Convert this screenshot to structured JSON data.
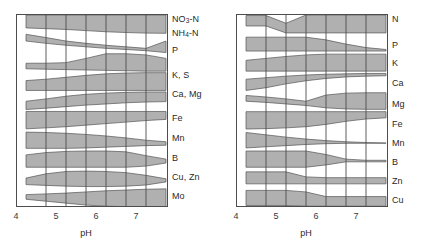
{
  "figure": {
    "band_fill": "#b0b0b0",
    "band_stroke": "#555555",
    "grid_color": "#4d4d4d",
    "frame_color": "#4d4d4d",
    "background": "#ffffff"
  },
  "panels": [
    {
      "id": "left",
      "xaxis": {
        "title": "pH",
        "min": 3.75,
        "max": 7.55,
        "tick_values": [
          4,
          5,
          6,
          7
        ],
        "tick_labels": [
          "4",
          "5",
          "6",
          "7"
        ],
        "gridline_values": [
          4.5,
          5.0,
          5.5,
          6.0,
          6.5,
          7.0
        ]
      },
      "nutrients": [
        {
          "label": "NO3-N",
          "label_html": "NO<sub>3</sub>-N"
        },
        {
          "label": "NH4-N",
          "label_html": "NH<sub>4</sub>-N"
        },
        {
          "label": "P",
          "label_html": "P"
        },
        {
          "label": "K, S",
          "label_html": "K, S"
        },
        {
          "label": "Ca, Mg",
          "label_html": "Ca, Mg"
        },
        {
          "label": "Fe",
          "label_html": "Fe"
        },
        {
          "label": "Mn",
          "label_html": "Mn"
        },
        {
          "label": "B",
          "label_html": "B"
        },
        {
          "label": "Cu, Zn",
          "label_html": "Cu, Zn"
        },
        {
          "label": "Mo",
          "label_html": "Mo"
        }
      ]
    },
    {
      "id": "right",
      "xaxis": {
        "title": "pH",
        "min": 3.75,
        "max": 7.55,
        "tick_values": [
          4,
          5,
          6,
          7
        ],
        "tick_labels": [
          "4",
          "5",
          "6",
          "7"
        ],
        "gridline_values": [
          4.5,
          5.0,
          5.5,
          6.0,
          6.5,
          7.0
        ]
      },
      "nutrients": [
        {
          "label": "N",
          "label_html": "N"
        },
        {
          "label": "P",
          "label_html": "P"
        },
        {
          "label": "K",
          "label_html": "K"
        },
        {
          "label": "Ca",
          "label_html": "Ca"
        },
        {
          "label": "Mg",
          "label_html": "Mg"
        },
        {
          "label": "Fe",
          "label_html": "Fe"
        },
        {
          "label": "Mn",
          "label_html": "Mn"
        },
        {
          "label": "B",
          "label_html": "B"
        },
        {
          "label": "Zn",
          "label_html": "Zn"
        },
        {
          "label": "Cu",
          "label_html": "Cu"
        }
      ]
    }
  ],
  "chart_data": {
    "type": "area",
    "title": "",
    "xlabel": "pH",
    "ylabel": "",
    "xlim": [
      3.75,
      7.55
    ],
    "grid": true,
    "legend": "right-side nutrient labels",
    "note": "Each horizontal band's thickness represents relative nutrient availability across pH. Band vertical extent given as top/bottom offsets (0 = top of the band's row slot, 1 = bottom) sampled at pH control points.",
    "charts": [
      {
        "panel": "left",
        "x": [
          4.0,
          4.5,
          5.0,
          5.5,
          6.0,
          6.5,
          7.0,
          7.5
        ],
        "bands": [
          {
            "name": "NO3-N",
            "top": [
              0.05,
              0.05,
              0.05,
              0.05,
              0.05,
              0.05,
              0.05,
              0.05
            ],
            "bottom": [
              0.72,
              0.76,
              0.8,
              0.86,
              0.92,
              0.96,
              0.99,
              1.0
            ]
          },
          {
            "name": "NH4-N",
            "top": [
              0.05,
              0.22,
              0.4,
              0.52,
              0.62,
              0.7,
              0.78,
              0.4
            ],
            "bottom": [
              0.4,
              0.52,
              0.62,
              0.7,
              0.78,
              0.84,
              0.9,
              1.0
            ]
          },
          {
            "name": "P",
            "top": [
              0.55,
              0.55,
              0.52,
              0.3,
              0.06,
              0.06,
              0.12,
              0.3
            ],
            "bottom": [
              0.84,
              0.86,
              0.88,
              0.9,
              0.92,
              0.94,
              0.96,
              0.96
            ]
          },
          {
            "name": "K, S",
            "top": [
              0.45,
              0.38,
              0.28,
              0.18,
              0.1,
              0.06,
              0.04,
              0.04
            ],
            "bottom": [
              0.96,
              0.96,
              0.96,
              0.96,
              0.96,
              0.96,
              0.96,
              0.96
            ]
          },
          {
            "name": "Ca, Mg",
            "top": [
              0.52,
              0.4,
              0.26,
              0.16,
              0.1,
              0.06,
              0.04,
              0.04
            ],
            "bottom": [
              0.95,
              0.88,
              0.8,
              0.72,
              0.66,
              0.6,
              0.56,
              0.54
            ]
          },
          {
            "name": "Fe",
            "top": [
              0.05,
              0.05,
              0.05,
              0.05,
              0.05,
              0.05,
              0.05,
              0.05
            ],
            "bottom": [
              0.95,
              0.9,
              0.84,
              0.76,
              0.68,
              0.6,
              0.52,
              0.46
            ]
          },
          {
            "name": "Mn",
            "top": [
              0.12,
              0.14,
              0.18,
              0.24,
              0.32,
              0.42,
              0.54,
              0.62
            ],
            "bottom": [
              0.96,
              0.96,
              0.96,
              0.94,
              0.9,
              0.86,
              0.82,
              0.8
            ]
          },
          {
            "name": "B",
            "top": [
              0.3,
              0.18,
              0.12,
              0.1,
              0.1,
              0.14,
              0.34,
              0.52
            ],
            "bottom": [
              0.94,
              0.94,
              0.94,
              0.94,
              0.94,
              0.94,
              0.88,
              0.72
            ]
          },
          {
            "name": "Cu, Zn",
            "top": [
              0.5,
              0.28,
              0.16,
              0.14,
              0.16,
              0.22,
              0.36,
              0.54
            ],
            "bottom": [
              0.84,
              0.88,
              0.92,
              0.94,
              0.94,
              0.92,
              0.86,
              0.7
            ]
          },
          {
            "name": "Mo",
            "top": [
              0.36,
              0.32,
              0.28,
              0.22,
              0.16,
              0.12,
              0.08,
              0.06
            ],
            "bottom": [
              0.6,
              0.7,
              0.8,
              0.9,
              0.96,
              0.98,
              0.99,
              1.0
            ]
          }
        ]
      },
      {
        "panel": "right",
        "x": [
          4.0,
          4.5,
          5.0,
          5.5,
          6.0,
          6.5,
          7.0,
          7.5
        ],
        "bands": [
          {
            "name": "N",
            "top": [
              0.08,
              0.08,
              0.48,
              0.05,
              0.05,
              0.05,
              0.05,
              0.05
            ],
            "bottom": [
              0.62,
              0.62,
              0.98,
              0.98,
              0.98,
              0.98,
              0.98,
              0.98
            ],
            "shape": "pinch"
          },
          {
            "name": "P",
            "top": [
              0.2,
              0.2,
              0.2,
              0.2,
              0.34,
              0.56,
              0.74,
              0.84
            ],
            "bottom": [
              0.92,
              0.92,
              0.92,
              0.92,
              0.92,
              0.92,
              0.92,
              0.92
            ]
          },
          {
            "name": "K",
            "top": [
              0.4,
              0.3,
              0.2,
              0.12,
              0.08,
              0.08,
              0.08,
              0.08
            ],
            "bottom": [
              0.96,
              0.96,
              0.96,
              0.96,
              0.96,
              0.96,
              0.96,
              0.96
            ]
          },
          {
            "name": "Ca",
            "top": [
              0.38,
              0.3,
              0.22,
              0.16,
              0.12,
              0.1,
              0.08,
              0.08
            ],
            "bottom": [
              0.96,
              0.82,
              0.62,
              0.46,
              0.34,
              0.26,
              0.22,
              0.2
            ]
          },
          {
            "name": "Mg",
            "top": [
              0.22,
              0.3,
              0.4,
              0.52,
              0.2,
              0.1,
              0.08,
              0.08
            ],
            "bottom": [
              0.52,
              0.58,
              0.66,
              0.74,
              0.86,
              0.92,
              0.94,
              0.94
            ]
          },
          {
            "name": "Fe",
            "top": [
              0.06,
              0.06,
              0.06,
              0.06,
              0.06,
              0.06,
              0.06,
              0.06
            ],
            "bottom": [
              0.96,
              0.94,
              0.9,
              0.84,
              0.72,
              0.56,
              0.44,
              0.38
            ]
          },
          {
            "name": "Mn",
            "top": [
              0.14,
              0.26,
              0.38,
              0.48,
              0.56,
              0.62,
              0.66,
              0.68
            ],
            "bottom": [
              0.94,
              0.88,
              0.82,
              0.76,
              0.72,
              0.7,
              0.7,
              0.7
            ]
          },
          {
            "name": "B",
            "top": [
              0.1,
              0.1,
              0.1,
              0.1,
              0.28,
              0.52,
              0.58,
              0.58
            ],
            "bottom": [
              0.94,
              0.94,
              0.94,
              0.94,
              0.82,
              0.66,
              0.66,
              0.66
            ]
          },
          {
            "name": "Zn",
            "top": [
              0.18,
              0.18,
              0.18,
              0.44,
              0.48,
              0.48,
              0.48,
              0.48
            ],
            "bottom": [
              0.8,
              0.8,
              0.8,
              0.8,
              0.8,
              0.8,
              0.8,
              0.8
            ]
          },
          {
            "name": "Cu",
            "top": [
              0.14,
              0.14,
              0.14,
              0.22,
              0.46,
              0.46,
              0.46,
              0.46
            ],
            "bottom": [
              0.92,
              0.92,
              0.92,
              0.96,
              0.96,
              0.96,
              0.96,
              0.96
            ]
          }
        ]
      }
    ]
  }
}
